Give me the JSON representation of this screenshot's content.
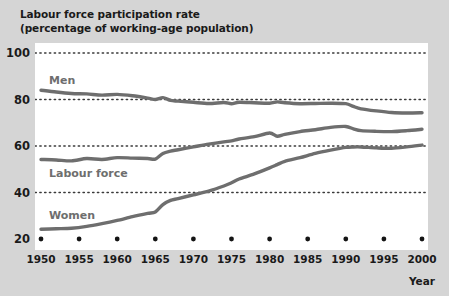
{
  "figure": {
    "title_line1": "Labour force participation rate",
    "title_line2": "(percentage of working-age population)",
    "background_color": "#d5d5d5",
    "plot_background_color": "#ffffff",
    "line_color": "#6e6e6e",
    "text_color": "#1a1a1a",
    "label_color": "#6e6e6e",
    "gridline_color": "#3a3a3a"
  },
  "chart_data": {
    "type": "line",
    "title": "Labour force participation rate (percentage of working-age population)",
    "xlabel": "Year",
    "ylabel": "",
    "xlim": [
      1950,
      2000
    ],
    "ylim": [
      20,
      100
    ],
    "xticks": [
      1950,
      1955,
      1960,
      1965,
      1970,
      1975,
      1980,
      1985,
      1990,
      1995,
      2000
    ],
    "yticks": [
      20,
      40,
      60,
      80,
      100
    ],
    "xtick_labels": [
      "1950",
      "1955",
      "1960",
      "1965",
      "1970",
      "1975",
      "1980",
      "1985",
      "1990",
      "1995",
      "2000"
    ],
    "ytick_labels": [
      "20",
      "40",
      "60",
      "80",
      "100"
    ],
    "grid": true,
    "grid_style": "dotted-horizontal",
    "legend": "inline-labels",
    "x": [
      1950,
      1952,
      1954,
      1956,
      1958,
      1960,
      1962,
      1964,
      1965,
      1966,
      1967,
      1968,
      1970,
      1972,
      1974,
      1975,
      1976,
      1978,
      1980,
      1981,
      1982,
      1984,
      1986,
      1988,
      1990,
      1991,
      1992,
      1994,
      1996,
      1998,
      2000
    ],
    "series": [
      {
        "name": "Men",
        "label": "Men",
        "color": "#6e6e6e",
        "values": [
          84.0,
          83.2,
          82.6,
          82.4,
          81.9,
          82.2,
          81.6,
          80.6,
          80.0,
          80.8,
          79.6,
          79.3,
          78.8,
          78.3,
          78.7,
          78.2,
          78.8,
          78.6,
          78.4,
          79.0,
          78.6,
          78.2,
          78.3,
          78.4,
          78.2,
          77.0,
          76.0,
          75.1,
          74.4,
          74.2,
          74.3
        ]
      },
      {
        "name": "Labour force",
        "label": "Labour force",
        "color": "#6e6e6e",
        "values": [
          54.2,
          54.0,
          53.6,
          54.6,
          54.2,
          55.0,
          54.8,
          54.6,
          54.4,
          56.8,
          57.8,
          58.4,
          59.6,
          60.8,
          61.8,
          62.2,
          63.0,
          64.0,
          65.6,
          64.2,
          65.0,
          66.2,
          67.0,
          68.0,
          68.4,
          67.4,
          66.6,
          66.3,
          66.2,
          66.6,
          67.2
        ]
      },
      {
        "name": "Women",
        "label": "Women",
        "color": "#6e6e6e",
        "values": [
          24.2,
          24.4,
          24.6,
          25.4,
          26.6,
          28.0,
          29.6,
          31.0,
          31.6,
          34.8,
          36.6,
          37.4,
          39.0,
          40.6,
          42.8,
          44.2,
          45.8,
          48.0,
          50.6,
          52.0,
          53.4,
          55.0,
          56.8,
          58.2,
          59.4,
          59.6,
          59.6,
          59.2,
          59.0,
          59.6,
          60.4
        ]
      }
    ]
  }
}
